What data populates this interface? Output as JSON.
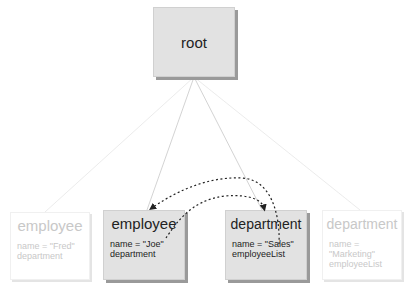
{
  "diagram": {
    "root": {
      "label": "root"
    },
    "nodes": [
      {
        "id": "emp1",
        "type": "employee",
        "fields": [
          "name = \"Fred\"",
          "department"
        ],
        "state": "faded"
      },
      {
        "id": "emp2",
        "type": "employee",
        "fields": [
          "name = \"Joe\"",
          "department"
        ],
        "state": "active"
      },
      {
        "id": "dep1",
        "type": "department",
        "fields": [
          "name = \"Sales\"",
          "employeeList"
        ],
        "state": "active"
      },
      {
        "id": "dep2",
        "type": "department",
        "fields": [
          "name = \"Marketing\"",
          "employeeList"
        ],
        "state": "faded"
      }
    ],
    "references": [
      {
        "from": "emp2.department",
        "to": "dep1",
        "style": "dashed"
      },
      {
        "from": "dep1.employeeList",
        "to": "emp2",
        "style": "dashed"
      }
    ],
    "colors": {
      "active_fill": "#e2e2e2",
      "shadow": "#9a9a9a",
      "link_line": "#c8c8c8",
      "reference_line": "#222222",
      "faded_text": "#c8c8c8"
    }
  }
}
